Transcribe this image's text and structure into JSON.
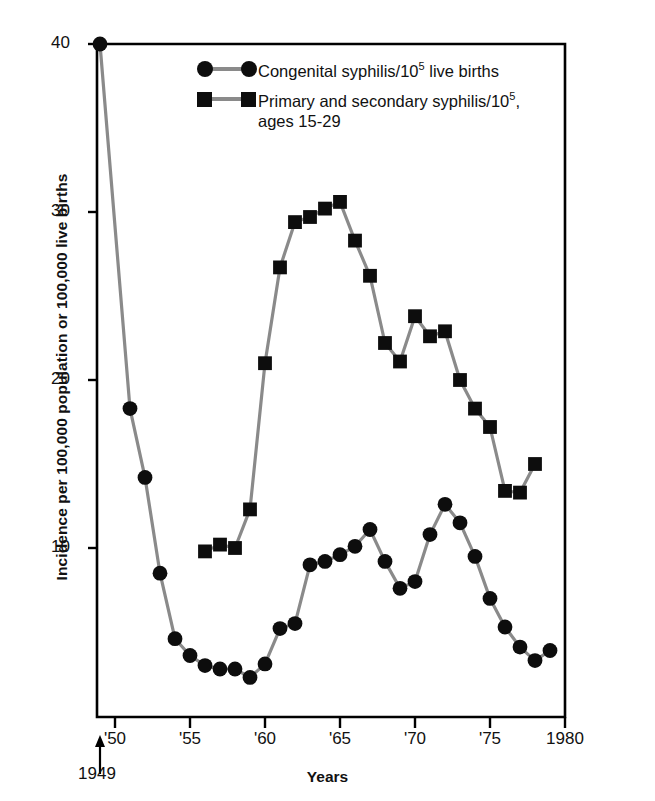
{
  "chart_data": {
    "type": "line",
    "title": "",
    "subtitle": "",
    "xlabel": "Years",
    "ylabel": "Incidence per 100,000 population or 100,000 live births",
    "xlim": [
      1949,
      1980
    ],
    "ylim": [
      0,
      40
    ],
    "grid": false,
    "legend_position": "upper-center",
    "x_tick_labels": [
      "'50",
      "'55",
      "'60",
      "'65",
      "'70",
      "'75",
      "1980"
    ],
    "x_tick_values": [
      1950,
      1955,
      1960,
      1965,
      1970,
      1975,
      1980
    ],
    "y_tick_labels": [
      "10",
      "20",
      "30",
      "40"
    ],
    "y_tick_values": [
      10,
      20,
      30,
      40
    ],
    "origin_annotation": "1949",
    "series": [
      {
        "name": "Congenital syphilis/10⁵ live births",
        "marker": "circle",
        "color": "#0d0d0d",
        "line_color": "#8a8a8a",
        "x": [
          1949,
          1951,
          1952,
          1953,
          1954,
          1955,
          1956,
          1957,
          1958,
          1959,
          1960,
          1961,
          1962,
          1963,
          1964,
          1965,
          1966,
          1967,
          1968,
          1969,
          1970,
          1971,
          1972,
          1973,
          1974,
          1975,
          1976,
          1977,
          1978,
          1979
        ],
        "values": [
          40.0,
          18.3,
          14.2,
          8.5,
          4.6,
          3.6,
          3.0,
          2.8,
          2.8,
          2.3,
          3.1,
          5.2,
          5.5,
          9.0,
          9.2,
          9.6,
          10.1,
          11.1,
          9.2,
          7.6,
          8.0,
          10.8,
          12.6,
          11.5,
          9.5,
          7.0,
          5.3,
          4.1,
          3.3,
          3.9
        ]
      },
      {
        "name": "Primary and secondary syphilis/10⁵, ages 15-29",
        "marker": "square",
        "color": "#0d0d0d",
        "line_color": "#8a8a8a",
        "x": [
          1956,
          1957,
          1958,
          1959,
          1960,
          1961,
          1962,
          1963,
          1964,
          1965,
          1966,
          1967,
          1968,
          1969,
          1970,
          1971,
          1972,
          1973,
          1974,
          1975,
          1976,
          1977,
          1978,
          1979
        ],
        "values": [
          9.8,
          10.2,
          10.0,
          12.3,
          21.0,
          26.7,
          29.4,
          29.7,
          30.2,
          30.6,
          28.3,
          26.2,
          22.2,
          21.1,
          23.8,
          22.6,
          22.9,
          20.0,
          18.3,
          17.2,
          13.4,
          13.3,
          15.0,
          null
        ]
      }
    ]
  },
  "legend": {
    "items": [
      {
        "marker": "circle",
        "text_before_sup": "Congenital syphilis/10",
        "sup": "5",
        "text_after_sup": " live births",
        "line2": ""
      },
      {
        "marker": "square",
        "text_before_sup": "Primary and secondary syphilis/10",
        "sup": "5",
        "text_after_sup": ",",
        "line2": "ages 15-29"
      }
    ]
  },
  "axes": {
    "y_title": "Incidence per 100,000 population or 100,000 live births",
    "x_title": "Years",
    "origin_year": "1949",
    "y_ticks": [
      "40",
      "30",
      "20",
      "10"
    ],
    "x_ticks": [
      "'50",
      "'55",
      "'60",
      "'65",
      "'70",
      "'75",
      "1980"
    ]
  },
  "colors": {
    "marker": "#0d0d0d",
    "line": "#8a8a8a",
    "axis": "#000000",
    "background": "#ffffff"
  }
}
